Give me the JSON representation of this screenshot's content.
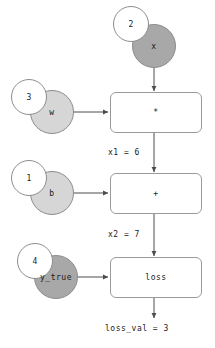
{
  "diagram": {
    "colors": {
      "node_dark": "#a8a8a8",
      "node_light": "#d6d6d6",
      "node_border": "#8c8c8c",
      "box_border": "#9a9a9a",
      "edge": "#4d4d4d",
      "text": "#1a1a1a",
      "background": "#ffffff"
    },
    "variables": [
      {
        "name": "x",
        "value": "2",
        "shade": "dark"
      },
      {
        "name": "w",
        "value": "3",
        "shade": "light"
      },
      {
        "name": "b",
        "value": "1",
        "shade": "light"
      },
      {
        "name": "y_true",
        "value": "4",
        "shade": "dark"
      }
    ],
    "operations": [
      {
        "label": "*"
      },
      {
        "label": "+"
      },
      {
        "label": "loss"
      }
    ],
    "edge_labels": [
      {
        "text": "x1 = 6"
      },
      {
        "text": "x2 = 7"
      }
    ],
    "output": {
      "text": "loss_val = 3"
    }
  }
}
